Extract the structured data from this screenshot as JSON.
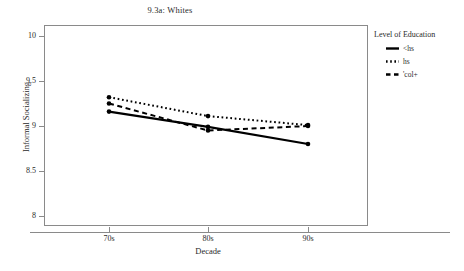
{
  "chart_data": {
    "type": "line",
    "title": "9.3a: Whites",
    "xlabel": "Decade",
    "ylabel": "Informal Socializing",
    "categories": [
      "70s",
      "80s",
      "90s"
    ],
    "ylim": [
      8,
      10
    ],
    "yticks": [
      "8",
      "8.5",
      "9",
      "9.5",
      "10"
    ],
    "ytick_values": [
      8,
      8.5,
      9,
      9.5,
      10
    ],
    "grid": false,
    "legend_position": "right",
    "legend_title": "Level of Education",
    "series": [
      {
        "name": "<hs",
        "style": "solid",
        "values": [
          9.16,
          8.99,
          8.8
        ]
      },
      {
        "name": "hs",
        "style": "dotted",
        "values": [
          9.32,
          9.11,
          9.01
        ]
      },
      {
        "name": "'col+",
        "style": "dashed",
        "values": [
          9.25,
          8.95,
          9.0
        ]
      }
    ]
  },
  "legend": {
    "title": "Level of Education",
    "items": [
      {
        "label": "<hs",
        "key": "solid-line-key"
      },
      {
        "label": "hs",
        "key": "dotted-line-key"
      },
      {
        "label": "'col+",
        "key": "dashed-line-key"
      }
    ]
  },
  "axes": {
    "y": {
      "label": "Informal Socializing",
      "ticks": [
        "10",
        "9.5",
        "9",
        "8.5",
        "8"
      ]
    },
    "x": {
      "label": "Decade",
      "ticks": [
        "70s",
        "80s",
        "90s"
      ]
    }
  }
}
